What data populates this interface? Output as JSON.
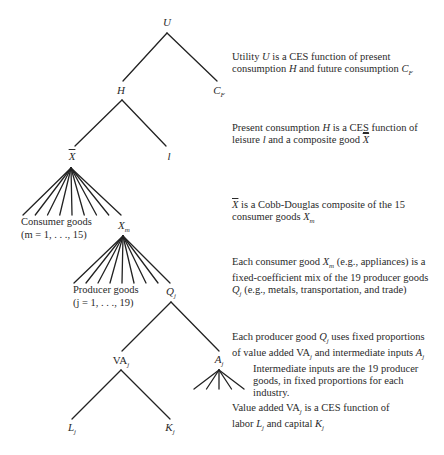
{
  "nodes": {
    "U": "U",
    "CF": "C",
    "CF_sub": "F",
    "H": "H",
    "Xbar": "X",
    "l": "l",
    "Xm": "X",
    "Xm_sub": "m",
    "Qj": "Q",
    "Qj_sub": "j",
    "VAj": "VA",
    "VAj_sub": "j",
    "Aj": "A",
    "Aj_sub": "j",
    "Lj": "L",
    "Lj_sub": "j",
    "Kj": "K",
    "Kj_sub": "j"
  },
  "labels": {
    "consumer_goods": "Consumer goods",
    "consumer_goods_range": "(m = 1, . . ., 15)",
    "producer_goods": "Producer goods",
    "producer_goods_range": "(j = 1, . . ., 19)"
  },
  "descriptions": [
    {
      "line1": "Utility U is a CES function of present",
      "line2": "consumption H and future consumption C_F"
    },
    {
      "line1": "Present consumption H is a CES function of",
      "line2": "leisure l and a composite good X̄"
    },
    {
      "line1": "X̄ is a Cobb-Douglas composite of the 15",
      "line2": "consumer goods X_m"
    },
    {
      "line1": "Each consumer good X_m (e.g., appliances) is a",
      "line2": "fixed-coefficient mix of the 19 producer goods",
      "line3": "Q_j (e.g., metals, transportation, and trade)"
    },
    {
      "line1": "Each producer good Q_j uses fixed proportions",
      "line2": "of value added VA_j and intermediate inputs A_j"
    },
    {
      "line1": "Intermediate inputs are the 19 producer",
      "line2": "goods, in fixed proportions for each",
      "line3": "industry."
    },
    {
      "line1": "Value added VA_j is a CES function of",
      "line2": "labor L_j and capital K_j"
    }
  ],
  "fans": {
    "consumer_goods_lines": 9,
    "producer_goods_lines": 9,
    "intermediate_inputs_lines": 5
  }
}
